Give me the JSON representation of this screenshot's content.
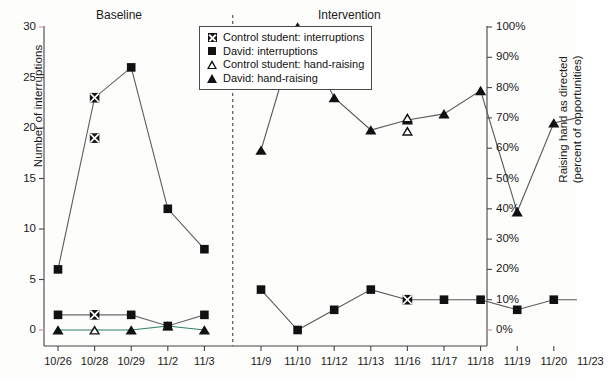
{
  "chart_data": {
    "type": "line",
    "title": "",
    "xlabel": "",
    "ylabel": "Number of interruptions",
    "ylabel_right_line1": "Raising hand as directed",
    "ylabel_right_line2": "(percent of opportunities)",
    "ylim": [
      0,
      30
    ],
    "ylim_right": [
      0,
      100
    ],
    "grid": false,
    "legend_position": "top-center-right",
    "x": [
      "10/26",
      "10/28",
      "10/29",
      "11/2",
      "11/3",
      "11/9",
      "11/10",
      "11/12",
      "11/13",
      "11/16",
      "11/17",
      "11/18",
      "11/19",
      "11/20",
      "11/23"
    ],
    "yticks_left": [
      "0",
      "5",
      "10",
      "15",
      "20",
      "25",
      "30"
    ],
    "yticks_right": [
      "0%",
      "10%",
      "20%",
      "30%",
      "40%",
      "50%",
      "60%",
      "70%",
      "80%",
      "90%",
      "100%"
    ],
    "phases": [
      {
        "label": "Baseline",
        "x_from": "10/26",
        "x_to": "11/3"
      },
      {
        "label": "Intervention",
        "x_from": "11/9",
        "x_to": "11/23"
      }
    ],
    "phase_divider_after": [
      "11/3",
      "11/23"
    ],
    "series": [
      {
        "name": "Control student: interruptions",
        "marker": "square-x",
        "axis": "left",
        "points": [
          {
            "x": "10/28",
            "y": 23
          },
          {
            "x": "10/28",
            "y": 19
          },
          {
            "x": "10/26",
            "y": 1.5
          },
          {
            "x": "10/28",
            "y": 1.5
          },
          {
            "x": "11/16",
            "y": 3
          }
        ]
      },
      {
        "name": "David: interruptions",
        "marker": "square-filled",
        "axis": "left",
        "values_upper": [
          6,
          23,
          26,
          12,
          8,
          4,
          0,
          2,
          4,
          3,
          3,
          3,
          2,
          3,
          3
        ],
        "values_baseline_low": [
          1.5,
          1.5,
          1.5,
          0.4,
          1.5
        ]
      },
      {
        "name": "Control student: hand-raising",
        "marker": "triangle-open",
        "axis": "right",
        "points": [
          {
            "x": "10/28",
            "y_left": 0,
            "y_pct": 0
          },
          {
            "x": "11/16",
            "y_left": 21.0,
            "y_pct": 70
          },
          {
            "x": "11/16",
            "y_left": 19.7,
            "y_pct": 66
          }
        ]
      },
      {
        "name": "David: hand-raising",
        "marker": "triangle-filled",
        "axis": "right",
        "values_left": [
          0,
          0,
          0,
          0.4,
          0,
          17.8,
          30,
          23,
          19.8,
          20.8,
          21.4,
          23.7,
          11.7,
          20.5,
          21.3
        ],
        "values_pct": [
          0,
          0,
          0,
          1,
          0,
          59,
          100,
          77,
          66,
          69,
          71,
          79,
          39,
          68,
          71
        ]
      }
    ],
    "legend": [
      {
        "key": "square-x",
        "label": "Control student: interruptions"
      },
      {
        "key": "square-filled",
        "label": "David: interruptions"
      },
      {
        "key": "triangle-open",
        "label": "Control student: hand-raising"
      },
      {
        "key": "triangle-filled",
        "label": "David: hand-raising"
      }
    ]
  }
}
